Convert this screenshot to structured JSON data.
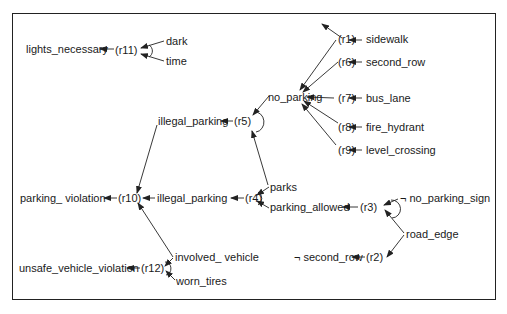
{
  "diagram": {
    "type": "rule-inference-network",
    "nodes": {
      "lights_necessary": "lights_necessary",
      "r11": "(r11)",
      "dark": "dark",
      "time": "time",
      "r1": "(r1)",
      "sidewalk": "sidewalk",
      "r6": "(r6)",
      "second_row": "second_row",
      "no_parking": "no_parking",
      "r7": "(r7)",
      "bus_lane": "bus_lane",
      "r8": "(r8)",
      "fire_hydrant": "fire_hydrant",
      "r9": "(r9)",
      "level_crossing": "level_crossing",
      "illegal_parking_top": "illegal_parking",
      "r5": "(r5)",
      "parking_violation": "parking_ violation",
      "r10": "(r10)",
      "illegal_parking_mid": "illegal_parking",
      "r4": "(r4)",
      "parks": "parks",
      "parking_allowed": "parking_allowed",
      "r3": "(r3)",
      "no_parking_sign": "¬ no_parking_sign",
      "road_edge": "road_edge",
      "not_second_row": "¬ second_row",
      "r2": "(r2)",
      "involved_vehicle": "involved_ vehicle",
      "unsafe_vehicle_violation": "unsafe_vehicle_violation",
      "r12": "(r12)",
      "worn_tires": "worn_tires"
    },
    "rules": [
      {
        "id": "r1",
        "premises": [
          "sidewalk"
        ],
        "conclusion": "no_parking"
      },
      {
        "id": "r2",
        "premises": [
          "road_edge"
        ],
        "conclusion": "¬ second_row"
      },
      {
        "id": "r3",
        "premises": [
          "¬ no_parking_sign",
          "road_edge"
        ],
        "conclusion": "parking_allowed",
        "conjunctive": true
      },
      {
        "id": "r4",
        "premises": [
          "parks",
          "parking_allowed"
        ],
        "conclusion": "illegal_parking",
        "conjunctive": true
      },
      {
        "id": "r5",
        "premises": [
          "no_parking",
          "parks"
        ],
        "conclusion": "illegal_parking",
        "conjunctive": true
      },
      {
        "id": "r6",
        "premises": [
          "second_row"
        ],
        "conclusion": "no_parking"
      },
      {
        "id": "r7",
        "premises": [
          "bus_lane"
        ],
        "conclusion": "no_parking"
      },
      {
        "id": "r8",
        "premises": [
          "fire_hydrant"
        ],
        "conclusion": "no_parking"
      },
      {
        "id": "r9",
        "premises": [
          "level_crossing"
        ],
        "conclusion": "no_parking"
      },
      {
        "id": "r10",
        "premises": [
          "illegal_parking",
          "involved_ vehicle"
        ],
        "conclusion": "parking_ violation"
      },
      {
        "id": "r11",
        "premises": [
          "dark",
          "time"
        ],
        "conclusion": "lights_necessary",
        "conjunctive": true
      },
      {
        "id": "r12",
        "premises": [
          "involved_ vehicle",
          "worn_tires"
        ],
        "conclusion": "unsafe_vehicle_violation",
        "conjunctive": true
      }
    ],
    "colors": {
      "line": "#222222",
      "text": "#1a1a1a",
      "background": "#ffffff"
    }
  }
}
